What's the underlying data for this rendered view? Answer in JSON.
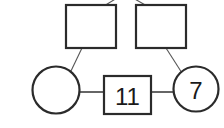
{
  "diagram": {
    "type": "node-link-tree",
    "background_color": "#ffffff",
    "stroke_color": "#2b2b2b",
    "edge_color": "#555555",
    "label_color": "#1a1a1a",
    "canvas": {
      "width": 224,
      "height": 128
    },
    "nodes": [
      {
        "id": "rect-top-left",
        "shape": "rectangle",
        "label": "",
        "x": 66,
        "y": 5,
        "width": 50,
        "height": 43,
        "stroke_width": 2.2
      },
      {
        "id": "rect-top-right",
        "shape": "rectangle",
        "label": "",
        "x": 136,
        "y": 5,
        "width": 50,
        "height": 43,
        "stroke_width": 2.2
      },
      {
        "id": "circle-bottom-left",
        "shape": "circle",
        "label": "",
        "cx": 56,
        "cy": 90,
        "r": 23.5,
        "stroke_width": 2.2
      },
      {
        "id": "square-bottom-center",
        "shape": "rectangle",
        "label": "11",
        "x": 104,
        "y": 76,
        "width": 47,
        "height": 38,
        "stroke_width": 2.2,
        "font_size": 22
      },
      {
        "id": "circle-bottom-right",
        "shape": "circle",
        "label": "7",
        "cx": 196,
        "cy": 89,
        "r": 22.5,
        "stroke_width": 2.2,
        "font_size": 22
      }
    ],
    "edges": [
      {
        "id": "edge-parent-to-rect-left",
        "from": "offscreen-parent",
        "to": "rect-top-left",
        "x1": 117,
        "y1": -2,
        "x2": 104,
        "y2": 6,
        "stroke_width": 1.1
      },
      {
        "id": "edge-parent-to-rect-right",
        "from": "offscreen-parent",
        "to": "rect-top-right",
        "x1": 133,
        "y1": -2,
        "x2": 147,
        "y2": 6,
        "stroke_width": 1.1
      },
      {
        "id": "edge-rect-left-to-circle-left",
        "from": "rect-top-left",
        "to": "circle-bottom-left",
        "x1": 82,
        "y1": 48,
        "x2": 70,
        "y2": 73,
        "stroke_width": 1.1
      },
      {
        "id": "edge-rect-right-to-circle-right",
        "from": "rect-top-right",
        "to": "circle-bottom-right",
        "x1": 166,
        "y1": 48,
        "x2": 182,
        "y2": 73,
        "stroke_width": 1.1
      },
      {
        "id": "edge-circle-left-to-square",
        "from": "circle-bottom-left",
        "to": "square-bottom-center",
        "x1": 79,
        "y1": 92,
        "x2": 105,
        "y2": 92,
        "stroke_width": 2.0
      },
      {
        "id": "edge-square-to-circle-right",
        "from": "square-bottom-center",
        "to": "circle-bottom-right",
        "x1": 150,
        "y1": 92,
        "x2": 175,
        "y2": 92,
        "stroke_width": 2.0
      }
    ]
  }
}
